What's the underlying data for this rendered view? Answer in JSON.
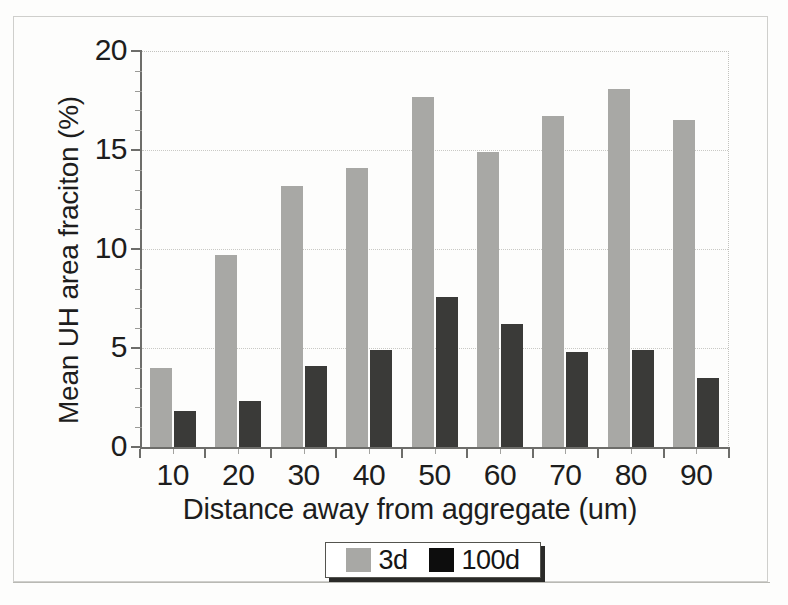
{
  "chart_data": {
    "type": "bar",
    "title": "",
    "xlabel": "Distance away from aggregate (um)",
    "ylabel": "Mean UH area fraciton (%)",
    "categories": [
      "10",
      "20",
      "30",
      "40",
      "50",
      "60",
      "70",
      "80",
      "90"
    ],
    "series": [
      {
        "name": "3d",
        "color": "#a8a8a5",
        "values": [
          4.0,
          9.7,
          13.2,
          14.1,
          17.7,
          14.9,
          16.7,
          18.1,
          16.5
        ]
      },
      {
        "name": "100d",
        "color": "#3a3a38",
        "values": [
          1.8,
          2.3,
          4.1,
          4.9,
          7.6,
          6.2,
          4.8,
          4.9,
          3.5
        ]
      }
    ],
    "ylim": [
      0,
      20
    ],
    "y_ticks": [
      "0",
      "5",
      "10",
      "15",
      "20"
    ],
    "y_tick_values": [
      0,
      5,
      10,
      15,
      20
    ],
    "y_minor_tick_values": [
      1,
      2,
      3,
      4,
      6,
      7,
      8,
      9,
      11,
      12,
      13,
      14,
      16,
      17,
      18,
      19
    ],
    "grid": "horizontal-dotted",
    "legend": {
      "position": "below-axis-center",
      "entries": [
        {
          "label": "3d",
          "swatch": "legend-swatch-3d",
          "color": "#a8a8a5"
        },
        {
          "label": "100d",
          "swatch": "legend-swatch-100d",
          "color": "#0d0d0d"
        }
      ]
    }
  }
}
